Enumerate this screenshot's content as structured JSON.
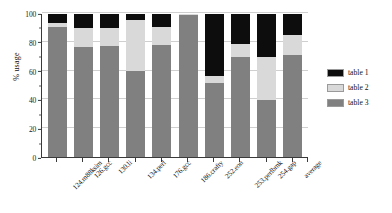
{
  "chart_data": {
    "type": "bar",
    "subtype": "stacked-bar-100",
    "title": "",
    "xlabel": "",
    "ylabel": "% usage",
    "ylim": [
      0,
      100
    ],
    "ytick_values": [
      0,
      20,
      40,
      60,
      80,
      100
    ],
    "ytick_labels": [
      "0",
      "20",
      "40",
      "60",
      "80",
      "100"
    ],
    "grid": true,
    "legend_position": "right",
    "categories": [
      "124.m88ksim",
      "126.gcc",
      "130.li",
      "134.perl",
      "176.gcc",
      "186.crafty",
      "252.eon",
      "253.perlbmk",
      "254.gap",
      "average"
    ],
    "series": [
      {
        "name": "table 1",
        "color": "#0d0d0d",
        "values": [
          6.0,
          10.0,
          9.5,
          4.0,
          9.0,
          0.0,
          43.5,
          21.0,
          30.0,
          15.0
        ]
      },
      {
        "name": "table 2",
        "color": "#d9d9d9",
        "values": [
          3.0,
          13.0,
          13.0,
          36.0,
          13.0,
          0.5,
          5.0,
          9.0,
          30.0,
          13.5
        ]
      },
      {
        "name": "table 3",
        "color": "#808080",
        "values": [
          91.0,
          77.0,
          77.5,
          60.0,
          78.0,
          99.5,
          51.5,
          70.0,
          40.0,
          71.5
        ]
      }
    ]
  },
  "legend": {
    "items": [
      {
        "label": "table 1",
        "color": "#0d0d0d"
      },
      {
        "label": "table 2",
        "color": "#d9d9d9"
      },
      {
        "label": "table 3",
        "color": "#808080"
      }
    ]
  },
  "axes": {
    "y_title": "% usage"
  }
}
